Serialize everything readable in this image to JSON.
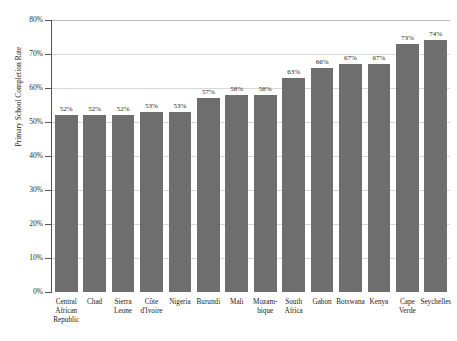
{
  "chart_data": {
    "type": "bar",
    "title": "",
    "xlabel": "",
    "ylabel": "Primary School Completion Rate",
    "ylim": [
      0,
      80
    ],
    "ytick_labels": [
      "80%",
      "70%",
      "60%",
      "50%",
      "40%",
      "30%",
      "20%",
      "10%",
      "0%"
    ],
    "ytick_values": [
      80,
      70,
      60,
      50,
      40,
      30,
      20,
      10,
      0
    ],
    "grid": true,
    "legend": "none",
    "bar_color": "#6e6e6e",
    "value_label_suffix": "%",
    "categories": [
      "Central African Republic",
      "Chad",
      "Sierra Leone",
      "Côte d'Ivoire",
      "Nigeria",
      "Burundi",
      "Mali",
      "Mozam-bique",
      "South Africa",
      "Gabon",
      "Botswana",
      "Kenya",
      "Cape Verde",
      "Seychelles"
    ],
    "values": [
      52,
      52,
      52,
      53,
      53,
      57,
      58,
      58,
      63,
      66,
      67,
      67,
      73,
      74
    ],
    "value_labels": [
      "52%",
      "52%",
      "52%",
      "53%",
      "53%",
      "57%",
      "58%",
      "58%",
      "63%",
      "66%",
      "67%",
      "67%",
      "73%",
      "74%"
    ],
    "category_lines": [
      [
        "Central",
        "African",
        "Republic"
      ],
      [
        "Chad"
      ],
      [
        "Sierra",
        "Leone"
      ],
      [
        "Côte",
        "d'Ivoire"
      ],
      [
        "Nigeria"
      ],
      [
        "Burundi"
      ],
      [
        "Mali"
      ],
      [
        "Mozam-",
        "bique"
      ],
      [
        "South",
        "Africa"
      ],
      [
        "Gabon"
      ],
      [
        "Botswana"
      ],
      [
        "Kenya"
      ],
      [
        "Cape",
        "Verde"
      ],
      [
        "Seychelles"
      ]
    ]
  }
}
